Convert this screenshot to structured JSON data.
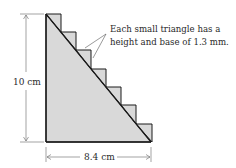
{
  "figure": {
    "annotation_line1": "Each small triangle has a",
    "annotation_line2": "height and base of 1.3 mm.",
    "height_label": "10 cm",
    "base_label": "8.4 cm",
    "small_triangle_count": 7,
    "fill_color": "#d9d9d9",
    "stroke_color": "#1a1a1a"
  }
}
